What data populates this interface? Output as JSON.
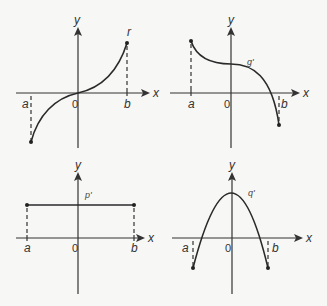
{
  "panels": [
    {
      "id": "top-left",
      "function_label": "r",
      "x_axis_label": "x",
      "y_axis_label": "y",
      "origin_label": "0",
      "a_label": "a",
      "b_label": "b",
      "shape": "increasing cubic-like curve through origin, from (a, negative) to (b, positive)"
    },
    {
      "id": "top-right",
      "function_label": "g'",
      "x_axis_label": "x",
      "y_axis_label": "y",
      "origin_label": "0",
      "a_label": "a",
      "b_label": "b",
      "shape": "decreasing cubic-like curve, positive y-intercept, crossing x-axis just before b"
    },
    {
      "id": "bottom-left",
      "function_label": "p'",
      "x_axis_label": "x",
      "y_axis_label": "y",
      "origin_label": "0",
      "a_label": "a",
      "b_label": "b",
      "shape": "horizontal constant line from a to b above x-axis"
    },
    {
      "id": "bottom-right",
      "function_label": "q'",
      "x_axis_label": "x",
      "y_axis_label": "y",
      "origin_label": "0",
      "a_label": "a",
      "b_label": "b",
      "shape": "downward parabola with vertex on y-axis, endpoints below x-axis at a and b"
    }
  ]
}
